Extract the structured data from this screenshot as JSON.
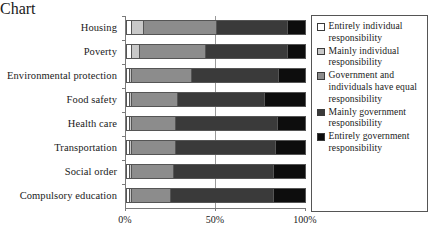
{
  "chart_data": {
    "type": "bar",
    "orientation": "horizontal",
    "stacked": true,
    "normalized_percent": true,
    "title": "",
    "xlabel": "",
    "ylabel": "",
    "xlim": [
      0,
      100
    ],
    "grid": true,
    "gridlines_at": [
      50
    ],
    "legend_position": "right",
    "xtick_labels": [
      "0%",
      "50%",
      "100%"
    ],
    "xtick_values": [
      0,
      50,
      100
    ],
    "categories": [
      "Housing",
      "Poverty",
      "Environmental protection",
      "Food safety",
      "Health care",
      "Transportation",
      "Social order",
      "Compulsory education"
    ],
    "series": [
      {
        "name": "Entirely individual responsibility",
        "color": "#ffffff",
        "values": [
          2,
          2,
          1,
          1,
          1,
          1,
          1,
          1
        ]
      },
      {
        "name": "Mainly individual responsibility",
        "color": "#c8c8c8",
        "values": [
          7,
          5,
          1,
          1,
          1,
          1,
          1,
          1
        ]
      },
      {
        "name": "Government and individuals have equal responsibility",
        "color": "#8c8c8c",
        "values": [
          41,
          37,
          34,
          26,
          25,
          25,
          24,
          22
        ]
      },
      {
        "name": "Mainly government responsibility",
        "color": "#3a3a3a",
        "values": [
          40,
          46,
          49,
          49,
          57,
          56,
          56,
          58
        ]
      },
      {
        "name": "Entirely government responsibility",
        "color": "#0d0d0d",
        "values": [
          10,
          10,
          15,
          23,
          16,
          17,
          18,
          18
        ]
      }
    ]
  },
  "legend": {
    "items": [
      {
        "label": "Entirely individual responsibility",
        "swatch_name": "legend-swatch-entirely-individual"
      },
      {
        "label": "Mainly individual responsibility",
        "swatch_name": "legend-swatch-mainly-individual"
      },
      {
        "label": "Government and individuals have equal responsibility",
        "swatch_name": "legend-swatch-equal"
      },
      {
        "label": "Mainly government responsibility",
        "swatch_name": "legend-swatch-mainly-government"
      },
      {
        "label": "Entirely government responsibility",
        "swatch_name": "legend-swatch-entirely-government"
      }
    ]
  }
}
